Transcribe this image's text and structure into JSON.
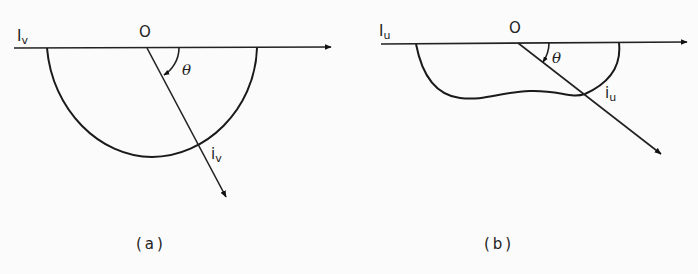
{
  "figure": {
    "panels": [
      {
        "id": "a",
        "caption": "(a)",
        "axis_label": "I",
        "axis_label_sub": "v",
        "origin_label": "O",
        "angle_label": "θ",
        "ray_label": "i",
        "ray_label_sub": "v",
        "region_shape": "semicircle"
      },
      {
        "id": "b",
        "caption": "(b)",
        "axis_label": "I",
        "axis_label_sub": "u",
        "origin_label": "O",
        "angle_label": "θ",
        "ray_label": "i",
        "ray_label_sub": "u",
        "region_shape": "irregular"
      }
    ]
  }
}
